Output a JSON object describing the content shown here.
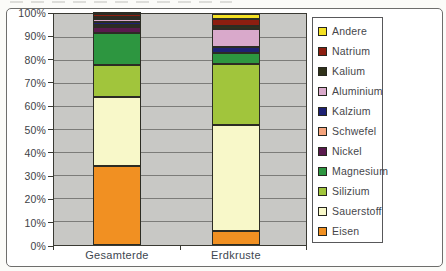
{
  "chart_data": {
    "type": "bar",
    "subtype": "stacked-percent",
    "title": "",
    "categories": [
      "Gesamterde",
      "Erdkruste"
    ],
    "series": [
      {
        "name": "Andere",
        "color": "#f3e024",
        "values": [
          0.5,
          2.0
        ]
      },
      {
        "name": "Natrium",
        "color": "#8c1e10",
        "values": [
          1.0,
          3.3
        ]
      },
      {
        "name": "Kalium",
        "color": "#30321a",
        "values": [
          0.5,
          1.3
        ]
      },
      {
        "name": "Aluminium",
        "color": "#d9a9cb",
        "values": [
          1.3,
          7.6
        ]
      },
      {
        "name": "Kalzium",
        "color": "#1e2173",
        "values": [
          1.3,
          2.6
        ]
      },
      {
        "name": "Schwefel",
        "color": "#f4a37c",
        "values": [
          1.2,
          0.0
        ]
      },
      {
        "name": "Nickel",
        "color": "#5a1a4e",
        "values": [
          2.2,
          0.0
        ]
      },
      {
        "name": "Magnesium",
        "color": "#2d9640",
        "values": [
          14.0,
          5.0
        ]
      },
      {
        "name": "Silizium",
        "color": "#a1c53c",
        "values": [
          14.0,
          26.4
        ]
      },
      {
        "name": "Sauerstoff",
        "color": "#f8f8c9",
        "values": [
          30.0,
          45.8
        ]
      },
      {
        "name": "Eisen",
        "color": "#f19022",
        "values": [
          34.0,
          6.0
        ]
      }
    ],
    "y_ticks": [
      "100%",
      "90%",
      "80%",
      "70%",
      "60%",
      "50%",
      "40%",
      "30%",
      "20%",
      "10%",
      "0%"
    ],
    "ylim": [
      0,
      100
    ],
    "grid": true,
    "legend_position": "right",
    "plot_bg_color": "#c8c8c5",
    "grid_color": "#7c7c79",
    "bar_border_color": "#2c2c24"
  }
}
